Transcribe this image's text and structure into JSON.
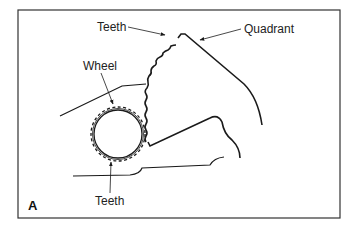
{
  "figure": {
    "panel_label": "A",
    "labels": {
      "teeth_top": "Teeth",
      "quadrant": "Quadrant",
      "wheel": "Wheel",
      "teeth_bottom": "Teeth"
    },
    "colors": {
      "line": "#1a1a1a",
      "frame": "#333333",
      "background": "#ffffff"
    }
  }
}
